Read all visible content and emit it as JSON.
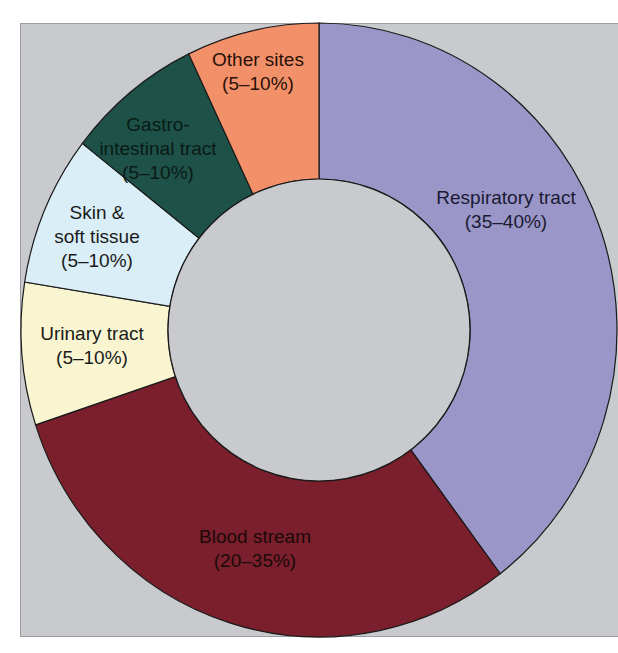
{
  "chart_data": {
    "type": "pie",
    "variant": "donut",
    "title": "",
    "background_color": "#c8cacd",
    "slices": [
      {
        "name": "Respiratory tract",
        "range_label": "(35–40%)",
        "label_lines": [
          "Respiratory tract",
          "(35–40%)"
        ],
        "range": [
          35,
          40
        ],
        "value": 39.6,
        "color": "#9a97c8",
        "text_color": "#1a1a33"
      },
      {
        "name": "Blood stream",
        "range_label": "(20–35%)",
        "label_lines": [
          "Blood stream",
          "(20–35%)"
        ],
        "range": [
          20,
          35
        ],
        "value": 30.4,
        "color": "#7a1f2b",
        "text_color": "#1a0a0a"
      },
      {
        "name": "Urinary tract",
        "range_label": "(5–10%)",
        "label_lines": [
          "Urinary tract",
          "(5–10%)"
        ],
        "range": [
          5,
          10
        ],
        "value": 7.5,
        "color": "#f8f5d0",
        "text_color": "#1a1a1a"
      },
      {
        "name": "Skin & soft tissue",
        "range_label": "(5–10%)",
        "label_lines": [
          "Skin &",
          "soft tissue",
          "(5–10%)"
        ],
        "range": [
          5,
          10
        ],
        "value": 7.9,
        "color": "#daeef8",
        "text_color": "#1a1a1a"
      },
      {
        "name": "Gastro-intestinal tract",
        "range_label": "(5–10%)",
        "label_lines": [
          "Gastro-",
          "intestinal tract",
          "(5–10%)"
        ],
        "range": [
          5,
          10
        ],
        "value": 7.4,
        "color": "#1e5248",
        "text_color": "#0a1a16"
      },
      {
        "name": "Other sites",
        "range_label": "(5–10%)",
        "label_lines": [
          "Other sites",
          "(5–10%)"
        ],
        "range": [
          5,
          10
        ],
        "value": 7.2,
        "color": "#f2906a",
        "text_color": "#2a1008"
      }
    ],
    "start_angle_deg": 0,
    "direction": "clockwise",
    "legend": "none"
  }
}
